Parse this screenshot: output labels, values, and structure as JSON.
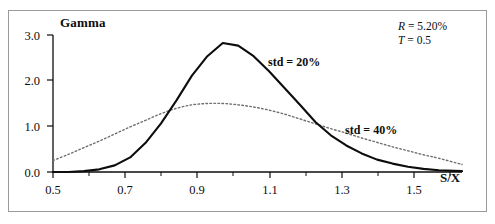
{
  "chart_data": {
    "type": "line",
    "title": "",
    "subtitle": "",
    "xlabel": "S/X",
    "ylabel": "Gamma",
    "xlim": [
      0.5,
      1.56
    ],
    "ylim": [
      0.0,
      3.1
    ],
    "grid": false,
    "legend_position": "inline-annotations",
    "xticks": [
      "0.5",
      "0.7",
      "0.9",
      "1.1",
      "1.3",
      "1.5"
    ],
    "xtick_values": [
      0.5,
      0.7,
      0.9,
      1.1,
      1.3,
      1.5
    ],
    "yticks": [
      "0.0",
      "1.0",
      "2.0",
      "3.0"
    ],
    "ytick_values": [
      0.0,
      1.0,
      2.0,
      3.0
    ],
    "minor_xticks": [
      0.6,
      0.8,
      1.0,
      1.2,
      1.4
    ],
    "x": [
      0.5,
      0.54,
      0.58,
      0.62,
      0.66,
      0.7,
      0.74,
      0.78,
      0.82,
      0.86,
      0.9,
      0.94,
      0.98,
      1.02,
      1.06,
      1.1,
      1.14,
      1.18,
      1.22,
      1.26,
      1.3,
      1.34,
      1.38,
      1.42,
      1.46,
      1.5,
      1.56
    ],
    "series": [
      {
        "name": "std = 20%",
        "label": "std = 20%",
        "style": "solid",
        "color": "#0d0d0d",
        "width": 2.1,
        "values": [
          0.0,
          0.0,
          0.02,
          0.06,
          0.15,
          0.33,
          0.66,
          1.1,
          1.62,
          2.18,
          2.62,
          2.92,
          2.86,
          2.62,
          2.28,
          1.9,
          1.52,
          1.13,
          0.83,
          0.6,
          0.42,
          0.28,
          0.19,
          0.12,
          0.07,
          0.04,
          0.02
        ]
      },
      {
        "name": "std = 40%",
        "label": "std = 40%",
        "style": "dotted",
        "color": "#6e6e6e",
        "width": 1.4,
        "values": [
          0.26,
          0.4,
          0.55,
          0.7,
          0.86,
          1.02,
          1.17,
          1.32,
          1.44,
          1.52,
          1.55,
          1.55,
          1.52,
          1.47,
          1.4,
          1.31,
          1.2,
          1.09,
          0.98,
          0.88,
          0.77,
          0.67,
          0.57,
          0.48,
          0.39,
          0.31,
          0.17
        ]
      }
    ],
    "annotations": [
      {
        "name": "rate",
        "symbol": "R",
        "equals": "=",
        "value": "5.20%"
      },
      {
        "name": "maturity",
        "symbol": "T",
        "equals": "=",
        "value": "0.5"
      }
    ]
  },
  "colors": {
    "frame_border": "#9a9a9a",
    "axis": "#0d0d0d",
    "text": "#0d0d0d",
    "solid_series": "#0d0d0d",
    "dotted_series": "#6e6e6e",
    "background": "#ffffff"
  }
}
